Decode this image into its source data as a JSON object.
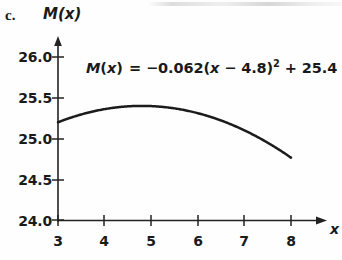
{
  "figure": {
    "part_label": "c.",
    "background_color": "#fefefe",
    "ink_color": "#1b1b1b"
  },
  "annotation": {
    "equation_plain": "M(x) = −0.062(x − 4.8)² + 25.4",
    "function_name": "M",
    "variable": "x",
    "open_paren": "(",
    "close_paren": ")",
    "equals": "=",
    "coefficient": "−0.062",
    "inner_minus": "−",
    "vertex_x": "4.8",
    "exponent": "2",
    "plus": "+",
    "vertex_y": "25.4"
  },
  "axes": {
    "y_name": "M(x)",
    "x_name": "x",
    "y_ticks": [
      "24.0",
      "24.5",
      "25.0",
      "25.5",
      "26.0"
    ],
    "x_ticks": [
      "3",
      "4",
      "5",
      "6",
      "7",
      "8"
    ],
    "y_min": 24.0,
    "y_max": 26.0,
    "x_min": 3,
    "x_max": 8
  },
  "chart_data": {
    "type": "line",
    "title": "",
    "subtitle": "",
    "xlabel": "x",
    "ylabel": "M(x)",
    "xlim": [
      3,
      8
    ],
    "ylim": [
      24.0,
      26.0
    ],
    "grid": false,
    "legend": "none",
    "annotations": [
      "M(x) = −0.062(x − 4.8)² + 25.4"
    ],
    "xticks": [
      3,
      4,
      5,
      6,
      7,
      8
    ],
    "yticks": [
      24.0,
      24.5,
      25.0,
      25.5,
      26.0
    ],
    "equation": {
      "form": "vertex",
      "a": -0.062,
      "h": 4.8,
      "k": 25.4
    },
    "series": [
      {
        "name": "M(x)",
        "color": "#1b1b1b",
        "x": [
          3.0,
          3.25,
          3.5,
          3.75,
          4.0,
          4.25,
          4.5,
          4.8,
          5.0,
          5.25,
          5.5,
          5.75,
          6.0,
          6.25,
          6.5,
          6.75,
          7.0,
          7.25,
          7.5,
          7.75,
          8.0
        ],
        "values": [
          25.199,
          25.24,
          25.271,
          25.295,
          25.31,
          25.32,
          25.394,
          25.4,
          25.397,
          25.388,
          25.369,
          25.344,
          25.31,
          25.269,
          25.22,
          25.163,
          25.1,
          25.028,
          24.949,
          24.862,
          24.765
        ]
      }
    ],
    "key_points": [
      {
        "label": "left endpoint",
        "x": 3,
        "y": 25.199
      },
      {
        "label": "vertex",
        "x": 4.8,
        "y": 25.4
      },
      {
        "label": "right endpoint",
        "x": 8,
        "y": 24.765
      }
    ]
  }
}
